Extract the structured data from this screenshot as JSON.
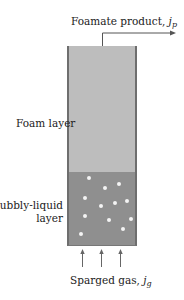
{
  "diagram": {
    "labels": {
      "product": "Foamate product, ",
      "product_symbol": "j",
      "product_subscript": "p",
      "foam_layer": "Foam layer",
      "bubbly_line1": "Bubbly-liquid",
      "bubbly_line2": "layer",
      "gas": "Sparged gas, ",
      "gas_symbol": "j",
      "gas_subscript": "g"
    },
    "colors": {
      "foam": "#bdbdbd",
      "liquid": "#8f8f8f",
      "wall": "#6e6e6e",
      "bubble": "#f4f4f4",
      "arrow": "#555555"
    },
    "bubbles": [
      {
        "x": 18,
        "y": 4
      },
      {
        "x": 34,
        "y": 14
      },
      {
        "x": 48,
        "y": 10
      },
      {
        "x": 14,
        "y": 24
      },
      {
        "x": 44,
        "y": 29
      },
      {
        "x": 30,
        "y": 32
      },
      {
        "x": 56,
        "y": 27
      },
      {
        "x": 14,
        "y": 42
      },
      {
        "x": 38,
        "y": 46
      },
      {
        "x": 60,
        "y": 45
      },
      {
        "x": 52,
        "y": 55
      },
      {
        "x": 10,
        "y": 60
      }
    ]
  }
}
